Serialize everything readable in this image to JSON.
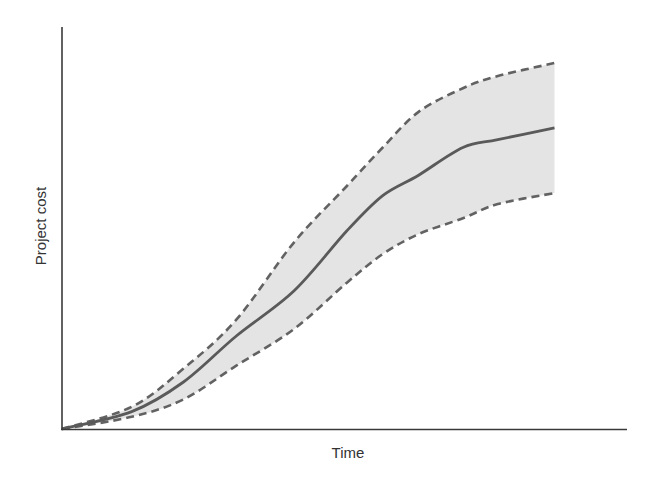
{
  "chart_data": {
    "type": "area",
    "title": "",
    "xlabel": "Time",
    "ylabel": "Project cost",
    "x_ticks": [],
    "y_ticks": [],
    "grid": false,
    "legend": null,
    "xlim": [
      0,
      1
    ],
    "ylim": [
      0,
      1
    ],
    "x": [
      0.0,
      0.14,
      0.244,
      0.35,
      0.466,
      0.572,
      0.644,
      0.716,
      0.805,
      0.875,
      0.989
    ],
    "series": [
      {
        "name": "Upper bound",
        "style": "dashed",
        "values": [
          0.0,
          0.06,
          0.163,
          0.295,
          0.504,
          0.656,
          0.76,
          0.856,
          0.92,
          0.953,
          0.988
        ]
      },
      {
        "name": "Expected cost",
        "style": "solid",
        "values": [
          0.0,
          0.047,
          0.127,
          0.251,
          0.373,
          0.535,
          0.63,
          0.685,
          0.76,
          0.781,
          0.813
        ]
      },
      {
        "name": "Lower bound",
        "style": "dashed",
        "values": [
          0.0,
          0.033,
          0.08,
          0.171,
          0.27,
          0.395,
          0.472,
          0.526,
          0.569,
          0.607,
          0.637
        ]
      }
    ],
    "band": {
      "between": [
        "Upper bound",
        "Lower bound"
      ],
      "fill": "#e4e4e4"
    },
    "colors": {
      "axis": "#3a3a3a",
      "solid_line": "#5a5a5a",
      "dashed_line": "#626262",
      "band_fill": "#e4e4e4"
    }
  },
  "labels": {
    "x_axis": "Time",
    "y_axis": "Project cost"
  }
}
